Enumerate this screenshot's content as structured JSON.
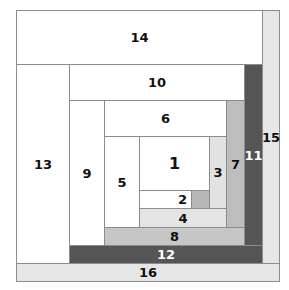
{
  "diagram": {
    "title": "",
    "blocks": [
      {
        "id": "14",
        "label": "14",
        "color": "#ffffff"
      },
      {
        "id": "15",
        "label": "15",
        "color": "#e6e6e6"
      },
      {
        "id": "13",
        "label": "13",
        "color": "#ffffff"
      },
      {
        "id": "10",
        "label": "10",
        "color": "#ffffff"
      },
      {
        "id": "11",
        "label": "11",
        "color": "#555555"
      },
      {
        "id": "9",
        "label": "9",
        "color": "#ffffff"
      },
      {
        "id": "6",
        "label": "6",
        "color": "#ffffff"
      },
      {
        "id": "7",
        "label": "7",
        "color": "#bdbdbd"
      },
      {
        "id": "5",
        "label": "5",
        "color": "#ffffff"
      },
      {
        "id": "1",
        "label": "1",
        "color": "#ffffff"
      },
      {
        "id": "3",
        "label": "3",
        "color": "#e2e2e2"
      },
      {
        "id": "2",
        "label": "2",
        "color": "#ffffff",
        "accent": "#b8b8b8"
      },
      {
        "id": "4",
        "label": "4",
        "color": "#e4e4e4"
      },
      {
        "id": "8",
        "label": "8",
        "color": "#c6c6c6"
      },
      {
        "id": "12",
        "label": "12",
        "color": "#555555"
      },
      {
        "id": "16",
        "label": "16",
        "color": "#e6e6e6"
      }
    ]
  }
}
